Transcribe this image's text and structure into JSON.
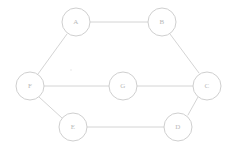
{
  "diagram": {
    "type": "undirected-graph",
    "canvas": {
      "width": 235,
      "height": 148
    },
    "style": {
      "background_color": "#ffffff",
      "edge_color": "#cfcfcf",
      "node_fill": "#ffffff",
      "node_stroke": "#c9c9c9",
      "label_color": "#b9b9b9",
      "node_radius": 14,
      "stroke_width": 0.9,
      "label_font_size": 7
    },
    "nodes": [
      {
        "id": "A",
        "label": "A",
        "cx": 76,
        "cy": 22,
        "r": 14
      },
      {
        "id": "B",
        "label": "B",
        "cx": 162,
        "cy": 22,
        "r": 14
      },
      {
        "id": "C",
        "label": "C",
        "cx": 207,
        "cy": 86,
        "r": 14
      },
      {
        "id": "D",
        "label": "D",
        "cx": 178,
        "cy": 127,
        "r": 14
      },
      {
        "id": "E",
        "label": "E",
        "cx": 73,
        "cy": 127,
        "r": 14
      },
      {
        "id": "F",
        "label": "F",
        "cx": 30,
        "cy": 86,
        "r": 14
      },
      {
        "id": "G",
        "label": "G",
        "cx": 123,
        "cy": 86,
        "r": 14
      }
    ],
    "edges": [
      {
        "id": "A-B",
        "from": "A",
        "to": "B",
        "x1": 90,
        "y1": 22,
        "x2": 148,
        "y2": 22
      },
      {
        "id": "B-C",
        "from": "B",
        "to": "C",
        "x1": 170,
        "y1": 34,
        "x2": 199,
        "y2": 73
      },
      {
        "id": "C-D",
        "from": "C",
        "to": "D",
        "x1": 198,
        "y1": 97,
        "x2": 188,
        "y2": 115
      },
      {
        "id": "D-E",
        "from": "D",
        "to": "E",
        "x1": 164,
        "y1": 127,
        "x2": 87,
        "y2": 127
      },
      {
        "id": "E-F",
        "from": "E",
        "to": "F",
        "x1": 62,
        "y1": 118,
        "x2": 39,
        "y2": 97
      },
      {
        "id": "F-A",
        "from": "F",
        "to": "A",
        "x1": 38,
        "y1": 74,
        "x2": 67,
        "y2": 34
      },
      {
        "id": "F-G",
        "from": "F",
        "to": "G",
        "x1": 44,
        "y1": 86,
        "x2": 109,
        "y2": 86
      },
      {
        "id": "G-C",
        "from": "G",
        "to": "C",
        "x1": 137,
        "y1": 86,
        "x2": 193,
        "y2": 86
      }
    ]
  }
}
